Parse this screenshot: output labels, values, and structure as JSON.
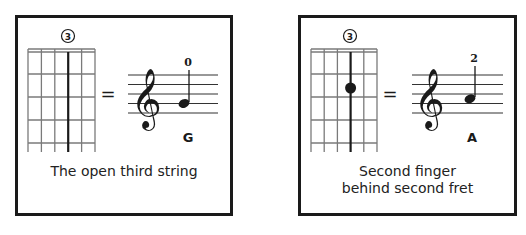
{
  "panels": [
    {
      "string_number": "3",
      "fingered_fret": null,
      "fret_number_label": "0",
      "note_name": "G",
      "equals": "=",
      "caption": "The open third string"
    },
    {
      "string_number": "3",
      "fingered_fret": 2,
      "fret_number_label": "2",
      "note_name": "A",
      "equals": "=",
      "caption": "Second finger behind second fret"
    }
  ],
  "colors": {
    "ink": "#1a1a1a",
    "grid": "#6e6e6e",
    "background": "#ffffff"
  }
}
